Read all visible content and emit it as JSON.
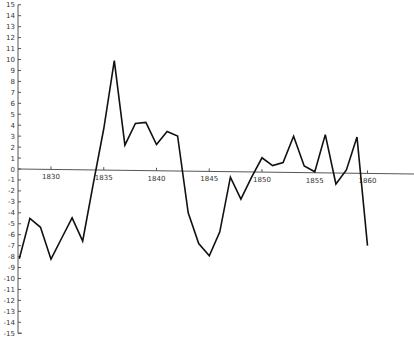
{
  "chart_data": {
    "type": "line",
    "title": "",
    "xlabel": "",
    "ylabel": "",
    "ylim": [
      -15,
      15
    ],
    "xlim": [
      1827,
      1860
    ],
    "grid": false,
    "legend": null,
    "y_ticks": [
      15,
      14,
      13,
      12,
      11,
      10,
      9,
      8,
      7,
      6,
      5,
      4,
      3,
      2,
      1,
      0,
      -1,
      -2,
      -3,
      -4,
      -5,
      -6,
      -7,
      -8,
      -9,
      -10,
      -11,
      -12,
      -13,
      -14,
      -15
    ],
    "x_ticks": [
      1830,
      1835,
      1840,
      1845,
      1850,
      1855,
      1860
    ],
    "x": [
      1827,
      1828,
      1829,
      1830,
      1831,
      1832,
      1833,
      1834,
      1835,
      1836,
      1837,
      1838,
      1839,
      1840,
      1841,
      1842,
      1843,
      1844,
      1845,
      1846,
      1847,
      1848,
      1849,
      1850,
      1851,
      1852,
      1853,
      1854,
      1855,
      1856,
      1857,
      1858,
      1859,
      1860
    ],
    "series": [
      {
        "name": "series",
        "color": "#111111",
        "values": [
          -8.2,
          -4.5,
          -5.3,
          -8.2,
          -6.3,
          -4.4,
          -6.5,
          -1.3,
          3.8,
          10.0,
          2.3,
          4.3,
          4.4,
          2.4,
          3.6,
          3.2,
          -3.8,
          -6.6,
          -7.7,
          -5.5,
          -0.5,
          -2.5,
          -0.5,
          1.3,
          0.6,
          0.9,
          3.3,
          0.6,
          0.1,
          3.5,
          -1.0,
          0.3,
          3.3,
          -6.6
        ]
      }
    ]
  }
}
